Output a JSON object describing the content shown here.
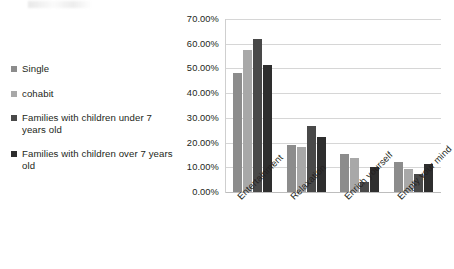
{
  "legend": {
    "items": [
      {
        "label": "Single",
        "color": "#8c8c8c"
      },
      {
        "label": "cohabit",
        "color": "#a8a8a8"
      },
      {
        "label": "Families with children under 7 years old",
        "color": "#494949"
      },
      {
        "label": "Families with children over 7 years old",
        "color": "#2e2e2e"
      }
    ]
  },
  "chart_data": {
    "type": "bar",
    "title": "",
    "xlabel": "",
    "ylabel": "",
    "ylim": [
      0,
      70
    ],
    "ytick_labels": [
      "0.00%",
      "10.00%",
      "20.00%",
      "30.00%",
      "40.00%",
      "50.00%",
      "60.00%",
      "70.00%"
    ],
    "ytick_values": [
      0,
      10,
      20,
      30,
      40,
      50,
      60,
      70
    ],
    "grid": true,
    "legend_position": "left",
    "categories": [
      "Entertainment",
      "Relaxation",
      "Enrich yourself",
      "Empty your mind"
    ],
    "series": [
      {
        "name": "Single",
        "color": "#8c8c8c",
        "values": [
          48.2,
          19.0,
          15.4,
          12.3
        ]
      },
      {
        "name": "cohabit",
        "color": "#a8a8a8",
        "values": [
          57.3,
          18.3,
          13.6,
          9.4
        ]
      },
      {
        "name": "Families with children under 7 years old",
        "color": "#494949",
        "values": [
          61.8,
          26.9,
          3.9,
          7.3
        ]
      },
      {
        "name": "Families with children over 7 years old",
        "color": "#2e2e2e",
        "values": [
          51.3,
          22.3,
          10.2,
          11.2
        ]
      }
    ]
  }
}
